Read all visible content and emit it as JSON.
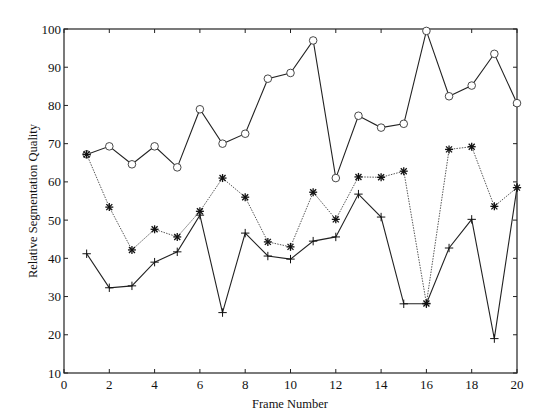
{
  "chart_data": {
    "type": "line",
    "title": "",
    "xlabel": "Frame Number",
    "ylabel": "Relative Segmentation Quality",
    "xlim": [
      0,
      20
    ],
    "ylim": [
      10,
      100
    ],
    "xticks": [
      0,
      2,
      4,
      6,
      8,
      10,
      12,
      14,
      16,
      18,
      20
    ],
    "yticks": [
      10,
      20,
      30,
      40,
      50,
      60,
      70,
      80,
      90,
      100
    ],
    "grid": false,
    "legend": null,
    "x": [
      1,
      2,
      3,
      4,
      5,
      6,
      7,
      8,
      9,
      10,
      11,
      12,
      13,
      14,
      15,
      16,
      17,
      18,
      19,
      20
    ],
    "series": [
      {
        "name": "circle-marker-series",
        "marker": "o",
        "line": "solid",
        "color": "#222222",
        "values": [
          67.2,
          69.3,
          64.6,
          69.3,
          63.8,
          79.0,
          70.0,
          72.6,
          87.0,
          88.5,
          97.0,
          61.0,
          77.3,
          74.2,
          75.2,
          99.5,
          82.4,
          85.2,
          93.5,
          80.6
        ]
      },
      {
        "name": "star-marker-series",
        "marker": "*",
        "line": "dotted",
        "color": "#222222",
        "values": [
          67.2,
          53.4,
          42.2,
          47.6,
          45.6,
          52.3,
          61.0,
          56.0,
          44.3,
          43.0,
          57.3,
          50.2,
          61.3,
          61.2,
          62.8,
          28.2,
          68.5,
          69.2,
          53.6,
          58.5
        ]
      },
      {
        "name": "plus-marker-series",
        "marker": "+",
        "line": "solid",
        "color": "#222222",
        "values": [
          41.2,
          32.3,
          32.8,
          39.0,
          41.7,
          51.3,
          25.8,
          46.6,
          40.6,
          39.8,
          44.5,
          45.6,
          56.8,
          50.8,
          28.1,
          28.1,
          42.7,
          50.2,
          19.0,
          58.5
        ]
      }
    ]
  }
}
